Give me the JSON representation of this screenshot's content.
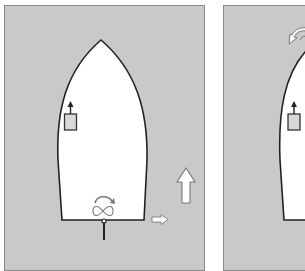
{
  "diagram": {
    "type": "boat-maneuvering-illustration",
    "colors": {
      "water": "#c9c9c9",
      "panel_border": "#8a8a8a",
      "hull_fill": "#ffffff",
      "hull_outline": "#222222",
      "arrow_fill": "#ffffff",
      "arrow_outline": "#6a6a6a"
    },
    "panels": [
      {
        "id": "left",
        "elements": [
          "hull",
          "helm-station",
          "propeller",
          "prop-rotation-arrow",
          "rudder",
          "stern-sideways-arrow",
          "forward-motion-arrow"
        ]
      },
      {
        "id": "right",
        "elements": [
          "hull",
          "helm-station",
          "bow-swing-arrow"
        ]
      }
    ]
  }
}
